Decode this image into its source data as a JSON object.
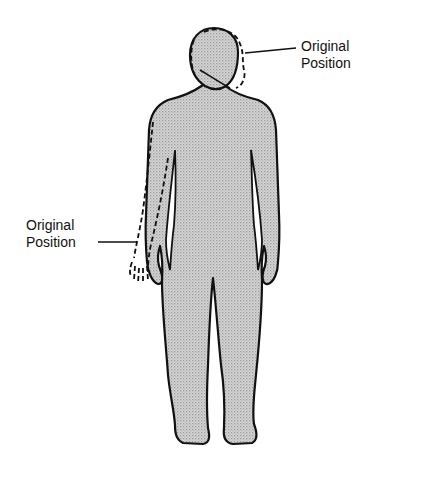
{
  "figure": {
    "labels": {
      "head_original": {
        "line1": "Original",
        "line2": "Position"
      },
      "arm_original": {
        "line1": "Original",
        "line2": "Position"
      }
    },
    "colors": {
      "fill": "#c8c8c8",
      "outline": "#111111",
      "background": "#ffffff"
    }
  }
}
